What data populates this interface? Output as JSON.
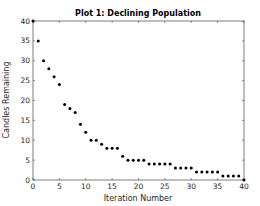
{
  "chart_data": {
    "type": "scatter",
    "title": "Plot 1: Declining Population",
    "xlabel": "Iteration Number",
    "ylabel": "Candles Remaining",
    "xlim": [
      0,
      40
    ],
    "ylim": [
      0,
      40
    ],
    "xticks": [
      0,
      5,
      10,
      15,
      20,
      25,
      30,
      35,
      40
    ],
    "yticks": [
      0,
      5,
      10,
      15,
      20,
      25,
      30,
      35,
      40
    ],
    "grid": false,
    "legend": null,
    "marker_color": "#000000",
    "axis_color": "#262626",
    "x": [
      0,
      1,
      2,
      3,
      4,
      5,
      6,
      7,
      8,
      9,
      10,
      11,
      12,
      13,
      14,
      15,
      16,
      17,
      18,
      19,
      20,
      21,
      22,
      23,
      24,
      25,
      26,
      27,
      28,
      29,
      30,
      31,
      32,
      33,
      34,
      35,
      36,
      37,
      38,
      39,
      40
    ],
    "y": [
      40,
      35,
      30,
      28,
      26,
      24,
      19,
      18,
      17,
      14,
      12,
      10,
      10,
      9,
      8,
      8,
      8,
      6,
      5,
      5,
      5,
      5,
      4,
      4,
      4,
      4,
      4,
      3,
      3,
      3,
      3,
      2,
      2,
      2,
      2,
      2,
      1,
      1,
      1,
      1,
      0
    ]
  }
}
